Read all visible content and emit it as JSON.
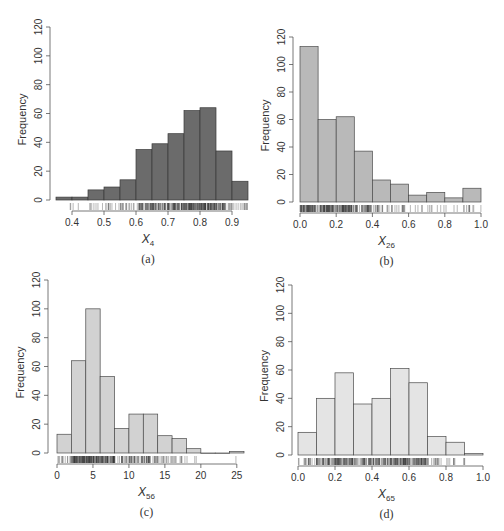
{
  "chart_data": [
    {
      "id": "a",
      "type": "bar",
      "subtype": "histogram",
      "caption": "(a)",
      "xlabel": "X",
      "xlabel_sub": "4",
      "ylabel": "Frequency",
      "bin_edges": [
        0.35,
        0.4,
        0.45,
        0.5,
        0.55,
        0.6,
        0.65,
        0.7,
        0.75,
        0.8,
        0.85,
        0.9,
        0.95
      ],
      "values": [
        2,
        2,
        7,
        9,
        14,
        35,
        39,
        46,
        62,
        64,
        34,
        13
      ],
      "xticks": [
        0.4,
        0.5,
        0.6,
        0.7,
        0.8,
        0.9
      ],
      "xtick_labels": [
        "0.4",
        "0.5",
        "0.6",
        "0.7",
        "0.8",
        "0.9"
      ],
      "yticks": [
        0,
        20,
        40,
        60,
        80,
        100,
        120
      ],
      "xlim": [
        0.35,
        0.95
      ],
      "ylim": [
        0,
        120
      ],
      "bar_color": "#6b6b6b",
      "edge_color": "#3a3a3a",
      "rug": true
    },
    {
      "id": "b",
      "type": "bar",
      "subtype": "histogram",
      "caption": "(b)",
      "xlabel": "X",
      "xlabel_sub": "26",
      "ylabel": "Frequency",
      "bin_edges": [
        0.0,
        0.1,
        0.2,
        0.3,
        0.4,
        0.5,
        0.6,
        0.7,
        0.8,
        0.9,
        1.0
      ],
      "values": [
        113,
        60,
        62,
        37,
        16,
        13,
        5,
        7,
        3,
        10
      ],
      "xticks": [
        0.0,
        0.2,
        0.4,
        0.6,
        0.8,
        1.0
      ],
      "xtick_labels": [
        "0.0",
        "0.2",
        "0.4",
        "0.6",
        "0.8",
        "1.0"
      ],
      "yticks": [
        0,
        20,
        40,
        60,
        80,
        100,
        120
      ],
      "xlim": [
        0.0,
        1.0
      ],
      "ylim": [
        0,
        120
      ],
      "bar_color": "#b9b9b9",
      "edge_color": "#4a4a4a",
      "rug": true
    },
    {
      "id": "c",
      "type": "bar",
      "subtype": "histogram",
      "caption": "(c)",
      "xlabel": "X",
      "xlabel_sub": "56",
      "ylabel": "Frequency",
      "bin_edges": [
        0,
        2,
        4,
        6,
        8,
        10,
        12,
        14,
        16,
        18,
        20,
        22,
        24,
        26
      ],
      "values": [
        13,
        64,
        100,
        53,
        17,
        27,
        27,
        12,
        10,
        3,
        0,
        0,
        1
      ],
      "xticks": [
        0,
        5,
        10,
        15,
        20,
        25
      ],
      "xtick_labels": [
        "0",
        "5",
        "10",
        "15",
        "20",
        "25"
      ],
      "yticks": [
        0,
        20,
        40,
        60,
        80,
        100,
        120
      ],
      "xlim": [
        0,
        26
      ],
      "ylim": [
        0,
        120
      ],
      "bar_color": "#d2d2d2",
      "edge_color": "#4a4a4a",
      "rug": true
    },
    {
      "id": "d",
      "type": "bar",
      "subtype": "histogram",
      "caption": "(d)",
      "xlabel": "X",
      "xlabel_sub": "65",
      "ylabel": "Frequency",
      "bin_edges": [
        0.0,
        0.1,
        0.2,
        0.3,
        0.4,
        0.5,
        0.6,
        0.7,
        0.8,
        0.9,
        1.0
      ],
      "values": [
        16,
        40,
        58,
        36,
        40,
        61,
        51,
        13,
        9,
        1
      ],
      "xticks": [
        0.0,
        0.2,
        0.4,
        0.6,
        0.8,
        1.0
      ],
      "xtick_labels": [
        "0.0",
        "0.2",
        "0.4",
        "0.6",
        "0.8",
        "1.0"
      ],
      "yticks": [
        0,
        20,
        40,
        60,
        80,
        100,
        120
      ],
      "xlim": [
        0.0,
        1.0
      ],
      "ylim": [
        0,
        120
      ],
      "bar_color": "#e4e4e4",
      "edge_color": "#4a4a4a",
      "rug": true
    }
  ],
  "layout": {
    "panels": [
      {
        "left": 0,
        "top": 0,
        "plotX0": 56,
        "plotX1": 248,
        "axisX": 50,
        "yTop": 27,
        "yZero": 200
      },
      {
        "left": 0,
        "top": 0,
        "plotX0": 300,
        "plotX1": 481,
        "axisX": 293,
        "yTop": 37,
        "yZero": 202
      },
      {
        "left": 0,
        "top": 0,
        "plotX0": 57,
        "plotX1": 244,
        "axisX": 48,
        "yTop": 280,
        "yZero": 453
      },
      {
        "left": 0,
        "top": 0,
        "plotX0": 298,
        "plotX1": 483,
        "axisX": 292,
        "yTop": 285,
        "yZero": 455
      }
    ]
  }
}
